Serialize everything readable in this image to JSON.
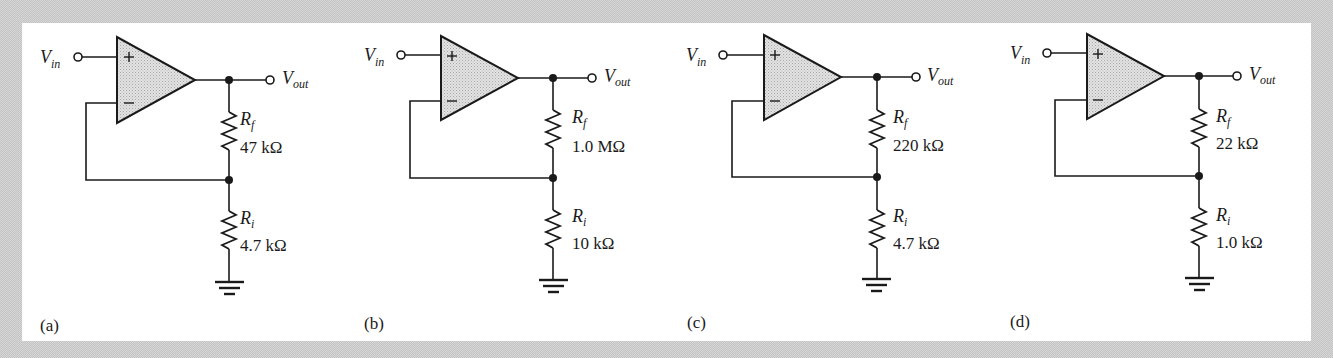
{
  "figure": {
    "colors": {
      "background": "#d6d6d6",
      "panel": "#ffffff",
      "ink": "#1a1a1a",
      "opamp_fill": "#d9d9d9"
    },
    "circuits": [
      {
        "id": "a",
        "caption": "(a)",
        "type": "non-inverting amplifier",
        "input_label": {
          "main": "V",
          "sub": "in"
        },
        "output_label": {
          "main": "V",
          "sub": "out"
        },
        "opamp": {
          "plus": "+",
          "minus": "–"
        },
        "rf": {
          "symbol": "R",
          "sub": "f",
          "value": "47 kΩ"
        },
        "ri": {
          "symbol": "R",
          "sub": "i",
          "value": "4.7 kΩ"
        }
      },
      {
        "id": "b",
        "caption": "(b)",
        "type": "non-inverting amplifier",
        "input_label": {
          "main": "V",
          "sub": "in"
        },
        "output_label": {
          "main": "V",
          "sub": "out"
        },
        "opamp": {
          "plus": "+",
          "minus": "–"
        },
        "rf": {
          "symbol": "R",
          "sub": "f",
          "value": "1.0 MΩ"
        },
        "ri": {
          "symbol": "R",
          "sub": "i",
          "value": "10 kΩ"
        }
      },
      {
        "id": "c",
        "caption": "(c)",
        "type": "non-inverting amplifier",
        "input_label": {
          "main": "V",
          "sub": "in"
        },
        "output_label": {
          "main": "V",
          "sub": "out"
        },
        "opamp": {
          "plus": "+",
          "minus": "–"
        },
        "rf": {
          "symbol": "R",
          "sub": "f",
          "value": "220 kΩ"
        },
        "ri": {
          "symbol": "R",
          "sub": "i",
          "value": "4.7 kΩ"
        }
      },
      {
        "id": "d",
        "caption": "(d)",
        "type": "non-inverting amplifier",
        "input_label": {
          "main": "V",
          "sub": "in"
        },
        "output_label": {
          "main": "V",
          "sub": "out"
        },
        "opamp": {
          "plus": "+",
          "minus": "–"
        },
        "rf": {
          "symbol": "R",
          "sub": "f",
          "value": "22 kΩ"
        },
        "ri": {
          "symbol": "R",
          "sub": "i",
          "value": "1.0 kΩ"
        }
      }
    ]
  }
}
